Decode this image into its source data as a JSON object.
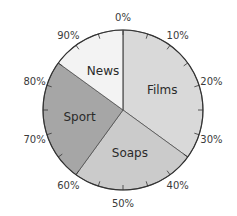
{
  "chart_data": {
    "type": "pie",
    "title": "",
    "start": "top",
    "direction": "clockwise",
    "scale_unit": "%",
    "scale_labels": [
      "0%",
      "10%",
      "20%",
      "30%",
      "40%",
      "50%",
      "60%",
      "70%",
      "80%",
      "90%"
    ],
    "minor_tick_step_percent": 5,
    "slices": [
      {
        "label": "Films",
        "value": 35,
        "color": "#d9d9d9"
      },
      {
        "label": "Soaps",
        "value": 25,
        "color": "#cbcbcb"
      },
      {
        "label": "Sport",
        "value": 25,
        "color": "#a6a6a6"
      },
      {
        "label": "News",
        "value": 15,
        "color": "#f3f3f3"
      }
    ]
  }
}
